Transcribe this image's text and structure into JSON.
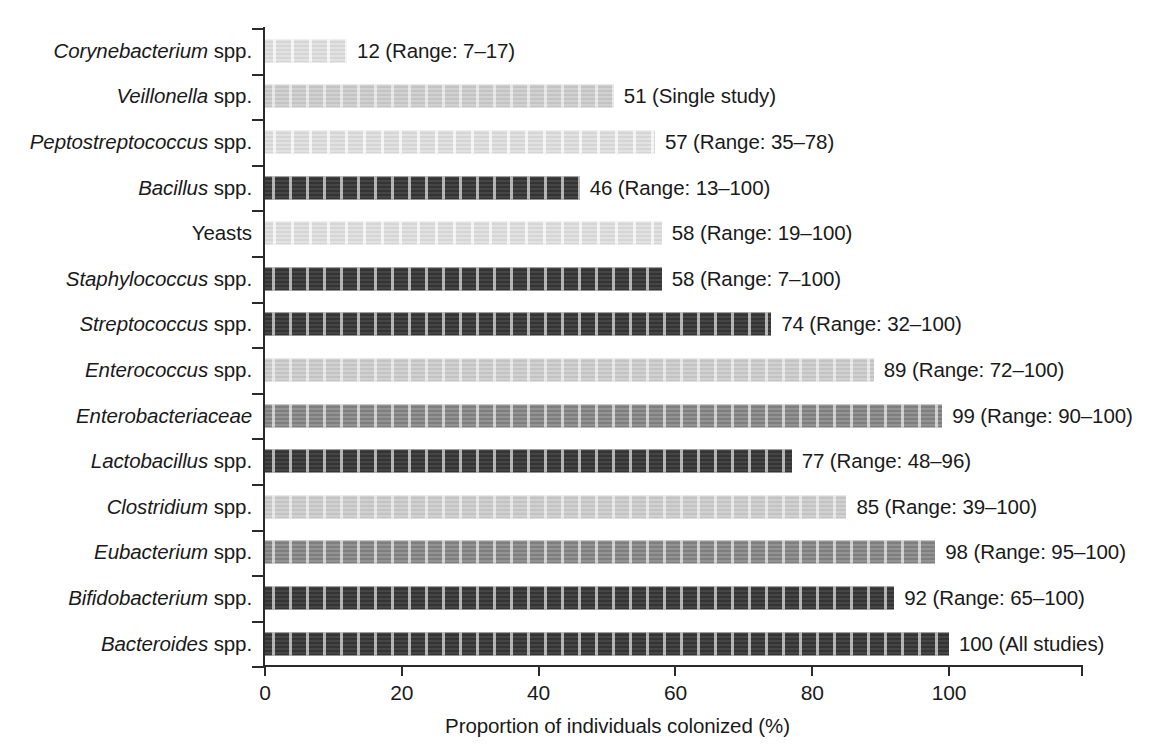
{
  "chart_data": {
    "type": "bar",
    "orientation": "horizontal",
    "title": "",
    "xlabel": "Proportion of individuals colonized (%)",
    "ylabel": "",
    "xlim": [
      0,
      120
    ],
    "xticks": [
      0,
      20,
      40,
      60,
      80,
      100
    ],
    "xtick_labels": [
      "0",
      "20",
      "40",
      "60",
      "80",
      "100"
    ],
    "grid": false,
    "legend": "none",
    "categories": [
      "Corynebacterium spp.",
      "Veillonella spp.",
      "Peptostreptococcus spp.",
      "Bacillus spp.",
      "Yeasts",
      "Staphylococcus spp.",
      "Streptococcus spp.",
      "Enterococcus spp.",
      "Enterobacteriaceae",
      "Lactobacillus spp.",
      "Clostridium spp.",
      "Eubacterium spp.",
      "Bifidobacterium spp.",
      "Bacteroides spp."
    ],
    "values": [
      12,
      51,
      57,
      46,
      58,
      58,
      74,
      89,
      99,
      77,
      85,
      98,
      92,
      100
    ],
    "annotations": [
      "12 (Range: 7–17)",
      "51 (Single study)",
      "57 (Range: 35–78)",
      "46 (Range: 13–100)",
      "58 (Range: 19–100)",
      "58 (Range: 7–100)",
      "74 (Range: 32–100)",
      "89 (Range: 72–100)",
      "99 (Range: 90–100)",
      "77 (Range: 48–96)",
      "85 (Range: 39–100)",
      "98 (Range: 95–100)",
      "92 (Range: 65–100)",
      "100 (All studies)"
    ]
  },
  "rows": [
    {
      "genus": "Corynebacterium",
      "suffix": " spp.",
      "italic_all": false,
      "value": 12,
      "annotation": "12 (Range: 7–17)",
      "shade": "verylight"
    },
    {
      "genus": "Veillonella",
      "suffix": " spp.",
      "italic_all": false,
      "value": 51,
      "annotation": "51 (Single study)",
      "shade": "light"
    },
    {
      "genus": "Peptostreptococcus",
      "suffix": " spp.",
      "italic_all": false,
      "value": 57,
      "annotation": "57 (Range: 35–78)",
      "shade": "verylight"
    },
    {
      "genus": "Bacillus",
      "suffix": " spp.",
      "italic_all": false,
      "value": 46,
      "annotation": "46 (Range: 13–100)",
      "shade": "dark"
    },
    {
      "genus": "Yeasts",
      "suffix": "",
      "italic_all": false,
      "value": 58,
      "annotation": "58 (Range: 19–100)",
      "shade": "verylight"
    },
    {
      "genus": "Staphylococcus",
      "suffix": " spp.",
      "italic_all": false,
      "value": 58,
      "annotation": "58 (Range: 7–100)",
      "shade": "dark"
    },
    {
      "genus": "Streptococcus",
      "suffix": " spp.",
      "italic_all": false,
      "value": 74,
      "annotation": "74 (Range: 32–100)",
      "shade": "dark"
    },
    {
      "genus": "Enterococcus",
      "suffix": " spp.",
      "italic_all": false,
      "value": 89,
      "annotation": "89 (Range: 72–100)",
      "shade": "light"
    },
    {
      "genus": "Enterobacteriaceae",
      "suffix": "",
      "italic_all": true,
      "value": 99,
      "annotation": "99 (Range: 90–100)",
      "shade": "mid"
    },
    {
      "genus": "Lactobacillus",
      "suffix": " spp.",
      "italic_all": false,
      "value": 77,
      "annotation": "77 (Range: 48–96)",
      "shade": "dark"
    },
    {
      "genus": "Clostridium",
      "suffix": " spp.",
      "italic_all": false,
      "value": 85,
      "annotation": "85 (Range: 39–100)",
      "shade": "light"
    },
    {
      "genus": "Eubacterium",
      "suffix": " spp.",
      "italic_all": false,
      "value": 98,
      "annotation": "98 (Range: 95–100)",
      "shade": "mid"
    },
    {
      "genus": "Bifidobacterium",
      "suffix": " spp.",
      "italic_all": false,
      "value": 92,
      "annotation": "92 (Range: 65–100)",
      "shade": "dark"
    },
    {
      "genus": "Bacteroides",
      "suffix": " spp.",
      "italic_all": false,
      "value": 100,
      "annotation": "100 (All studies)",
      "shade": "dark"
    }
  ],
  "axis": {
    "x_title": "Proportion of individuals colonized (%)",
    "ticks": [
      "0",
      "20",
      "40",
      "60",
      "80",
      "100"
    ]
  },
  "colors": {
    "dark": "#3b3b3b",
    "mid": "#8c8c8c",
    "light": "#cfcfcf",
    "verylight": "#e0e0e0",
    "axis": "#2b2b2b",
    "text": "#1a1a1a"
  }
}
